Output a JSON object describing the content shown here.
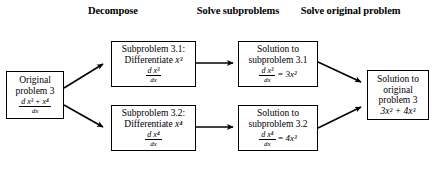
{
  "diagram": {
    "type": "flowchart",
    "background_color": "#ffffff",
    "line_color": "#000000",
    "headers": [
      {
        "id": "decompose",
        "label": "Decompose"
      },
      {
        "id": "solve-subproblems",
        "label_line1": "Solve",
        "label_line2": "subproblems"
      },
      {
        "id": "solve-original",
        "label_line1": "Solve original",
        "label_line2": "problem"
      }
    ],
    "nodes": {
      "original_problem": {
        "line1": "Original",
        "line2": "problem 3",
        "fraction_numerator_prefix": "d",
        "fraction_numerator_expr": "x³ + x⁴",
        "fraction_denominator": "dx"
      },
      "subproblem_31": {
        "line1": "Subproblem 3.1:",
        "line2": "Differentiate",
        "line2_var": "x³",
        "fraction_numerator_prefix": "d",
        "fraction_numerator_expr": "x³",
        "fraction_denominator": "dx"
      },
      "subproblem_32": {
        "line1": "Subproblem 3.2:",
        "line2": "Differentiate",
        "line2_var": "x⁴",
        "fraction_numerator_prefix": "d",
        "fraction_numerator_expr": "x⁴",
        "fraction_denominator": "dx"
      },
      "solution_31": {
        "line1": "Solution to",
        "line2": "subproblem 3.1",
        "fraction_numerator_prefix": "d",
        "fraction_numerator_expr": "x³",
        "fraction_denominator": "dx",
        "equals": "=",
        "result": "3x²"
      },
      "solution_32": {
        "line1": "Solution to",
        "line2": "subproblem 3.2",
        "fraction_numerator_prefix": "d",
        "fraction_numerator_expr": "x⁴",
        "fraction_denominator": "dx",
        "equals": "=",
        "result": "4x³"
      },
      "solution_original": {
        "line1": "Solution to",
        "line2": "original",
        "line3": "problem 3",
        "result": "3x² + 4x³"
      }
    },
    "edges": [
      {
        "from": "original_problem",
        "to": "subproblem_31",
        "style": "diagonal-up",
        "arrowhead": true
      },
      {
        "from": "original_problem",
        "to": "subproblem_32",
        "style": "diagonal-down",
        "arrowhead": true
      },
      {
        "from": "subproblem_31",
        "to": "solution_31",
        "style": "horizontal",
        "arrowhead": true
      },
      {
        "from": "subproblem_32",
        "to": "solution_32",
        "style": "horizontal",
        "arrowhead": true
      },
      {
        "from": "solution_31",
        "to": "solution_original",
        "style": "diagonal-down",
        "arrowhead": true
      },
      {
        "from": "solution_32",
        "to": "solution_original",
        "style": "diagonal-up",
        "arrowhead": true
      }
    ]
  }
}
